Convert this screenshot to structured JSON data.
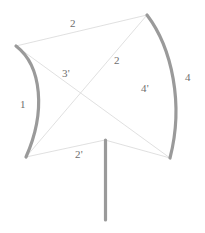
{
  "figure": {
    "canvas": {
      "width": 205,
      "height": 233,
      "background": "#ffffff"
    },
    "colors": {
      "thick_stroke": "#9a9a9a",
      "thin_stroke": "#d8d8d8",
      "label_text": "#6e6e6e"
    },
    "stroke_widths": {
      "thick": 3.2,
      "thin": 0.7
    },
    "vertices": {
      "top_left": {
        "x": 16,
        "y": 46
      },
      "top_right": {
        "x": 147,
        "y": 15
      },
      "bottom_left": {
        "x": 26,
        "y": 157
      },
      "bottom_right": {
        "x": 170,
        "y": 158
      },
      "bottom_middle": {
        "x": 105,
        "y": 140
      },
      "stem_bottom": {
        "x": 105,
        "y": 220
      },
      "diagonal_crossing": {
        "x": 85,
        "y": 98
      }
    },
    "edges": [
      {
        "name": "left-curved-edge",
        "kind": "thick-curve",
        "from": "top_left",
        "to": "bottom_left",
        "bulge": "right"
      },
      {
        "name": "right-curved-edge",
        "kind": "thick-curve",
        "from": "top_right",
        "to": "bottom_right",
        "bulge": "right"
      },
      {
        "name": "top-edge",
        "kind": "thin-line",
        "from": "top_left",
        "to": "top_right"
      },
      {
        "name": "bottom-left-edge",
        "kind": "thin-line",
        "from": "bottom_left",
        "to": "bottom_middle"
      },
      {
        "name": "bottom-right-edge",
        "kind": "thin-line",
        "from": "bottom_middle",
        "to": "bottom_right"
      },
      {
        "name": "diagonal-top-left-to-bottom-right",
        "kind": "thin-line",
        "from": "top_left",
        "to": "bottom_right"
      },
      {
        "name": "diagonal-top-right-to-bottom-left",
        "kind": "thin-line",
        "from": "top_right",
        "to": "bottom_left"
      },
      {
        "name": "vertical-stem",
        "kind": "thick-line",
        "from": "bottom_middle",
        "to": "stem_bottom"
      }
    ],
    "labels": [
      {
        "id": "label-top-2",
        "text": "2",
        "x": 70,
        "y": 18
      },
      {
        "id": "label-mid-2",
        "text": "2",
        "x": 114,
        "y": 55
      },
      {
        "id": "label-3-prime",
        "text": "3'",
        "x": 62,
        "y": 68
      },
      {
        "id": "label-4-prime",
        "text": "4'",
        "x": 141,
        "y": 83
      },
      {
        "id": "label-right-4",
        "text": "4",
        "x": 185,
        "y": 72
      },
      {
        "id": "label-left-1",
        "text": "1",
        "x": 20,
        "y": 99
      },
      {
        "id": "label-2-prime",
        "text": "2'",
        "x": 75,
        "y": 149
      }
    ]
  }
}
